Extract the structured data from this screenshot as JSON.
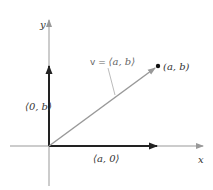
{
  "diagram": {
    "axes": {
      "x_label": "x",
      "y_label": "y"
    },
    "vectors": {
      "v_label_prefix": "v = ",
      "v_label": "⟨a, b⟩",
      "horizontal_label": "⟨a, 0⟩",
      "vertical_label": "⟨0, b⟩"
    },
    "point": {
      "label": "(a, b)"
    },
    "colors": {
      "axis": "#999999",
      "component_vectors": "#222222",
      "v_vector": "#999999",
      "leader_line": "#aaaaaa",
      "point": "#111111"
    }
  }
}
